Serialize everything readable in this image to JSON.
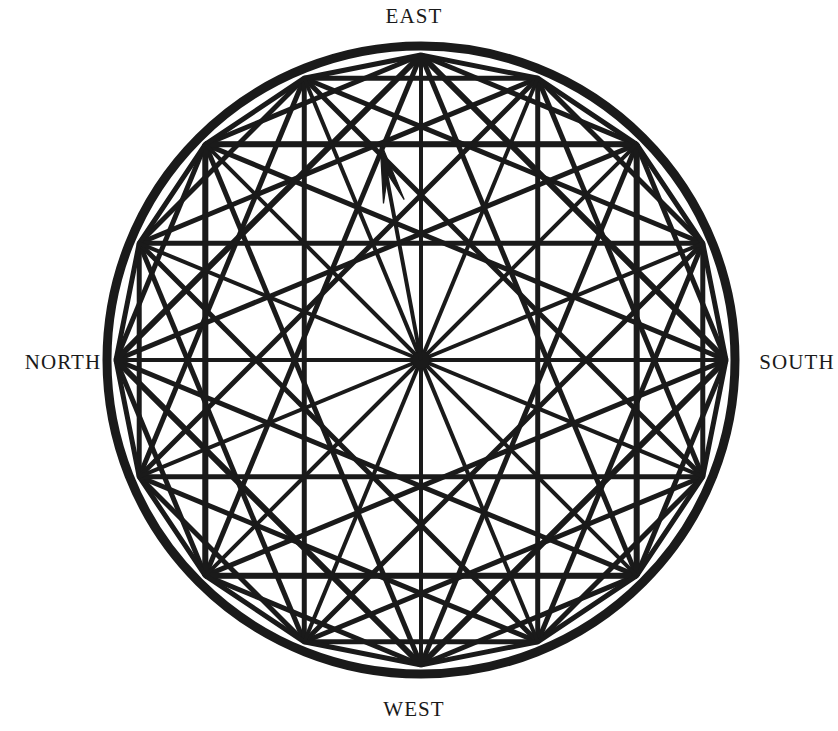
{
  "figure": {
    "kind": "compass-rose-geometric-diagram",
    "title_visible": false,
    "background_color": "#ffffff",
    "ink_color": "#1a1a1a"
  },
  "labels": {
    "top": "EAST",
    "bottom": "WEST",
    "left": "NORTH",
    "right": "SOUTH"
  },
  "chart_data": {
    "type": "scatter",
    "title": "",
    "xlabel": "",
    "ylabel": "",
    "grid": false,
    "legend": "none",
    "geometry": {
      "center": {
        "x": 421,
        "y": 360
      },
      "outer_circle_radius": 314,
      "outer_circle_stroke_width": 9,
      "polygon_radius": 305,
      "polygon_sides": 16,
      "polygon_stroke_width": 5,
      "chord_stroke_width": 5,
      "spoke_stroke_width": 4,
      "angle_step_degrees": 22.5,
      "start_angle_degrees": 90
    },
    "vertices_degrees": [
      90,
      112.5,
      135,
      157.5,
      180,
      202.5,
      225,
      247.5,
      270,
      292.5,
      315,
      337.5,
      0,
      22.5,
      45,
      67.5
    ],
    "squares": [
      {
        "name": "axis-aligned-square",
        "vertex_indices": [
          0,
          4,
          8,
          12
        ],
        "half_diagonal": 305
      },
      {
        "name": "rotated-square",
        "vertex_indices": [
          2,
          6,
          10,
          14
        ],
        "half_diagonal": 305
      }
    ],
    "chord_skip_steps": [
      2,
      4,
      6
    ],
    "spokes_count": 16,
    "arrow": {
      "name": "north-pointing-arrow",
      "from": {
        "x": 421,
        "y": 360
      },
      "to": {
        "x": 380,
        "y": 141
      },
      "head_length": 62,
      "head_half_width": 13,
      "stroke_width": 4
    }
  }
}
